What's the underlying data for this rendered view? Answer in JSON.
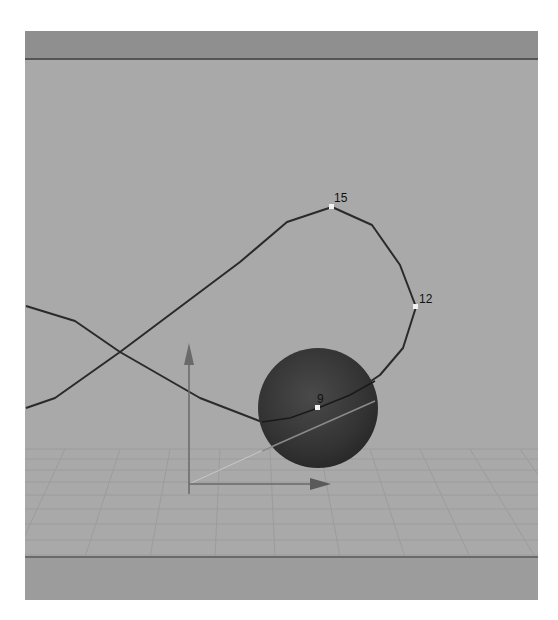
{
  "viewport": {
    "background": "#a9a9a9",
    "top_bar_color": "#8f8f8f",
    "bottom_bar_color": "#9c9c9c"
  },
  "motion_path": {
    "color": "#2a2a2a",
    "keyframes": [
      {
        "label": "15",
        "x": 307,
        "y": 176
      },
      {
        "label": "12",
        "x": 391,
        "y": 276
      },
      {
        "label": "9",
        "x": 293,
        "y": 377
      }
    ]
  },
  "sphere": {
    "center_x": 268,
    "center_y": 377,
    "radius": 60,
    "color": "#3a3a3a"
  },
  "manipulator": {
    "origin_x": 164,
    "origin_y": 453,
    "y_axis_top": 312,
    "x_axis_end": 306,
    "color": "#6a6a6a"
  }
}
